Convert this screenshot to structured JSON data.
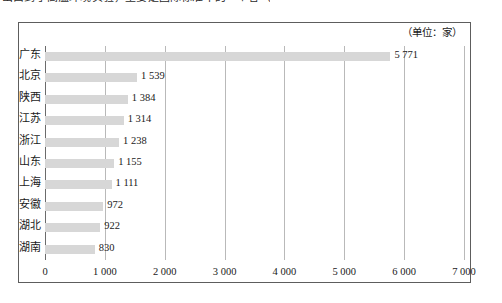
{
  "page": {
    "clipped_text_line": "出口到了高温环境实验，主要是国际标准中的一个省（省会城市）中。"
  },
  "chart": {
    "unit_label": "（单位：家）"
  },
  "chart_data": {
    "type": "bar",
    "orientation": "horizontal",
    "title": "",
    "subtitle": "",
    "unit": "（单位：家）",
    "xlabel": "",
    "ylabel": "",
    "xlim": [
      0,
      7000
    ],
    "xticks": [
      0,
      1000,
      2000,
      3000,
      4000,
      5000,
      6000,
      7000
    ],
    "xtick_labels": [
      "0",
      "1 000",
      "2 000",
      "3 000",
      "4 000",
      "5 000",
      "6 000",
      "7 000"
    ],
    "grid": true,
    "legend": false,
    "bar_color": "#d7d7d7",
    "categories": [
      "广东",
      "北京",
      "陕西",
      "江苏",
      "浙江",
      "山东",
      "上海",
      "安徽",
      "湖北",
      "湖南"
    ],
    "values": [
      5771,
      1539,
      1384,
      1314,
      1238,
      1155,
      1111,
      972,
      922,
      830
    ],
    "value_labels": [
      "5 771",
      "1 539",
      "1 384",
      "1 314",
      "1 238",
      "1 155",
      "1 111",
      "972",
      "922",
      "830"
    ]
  }
}
